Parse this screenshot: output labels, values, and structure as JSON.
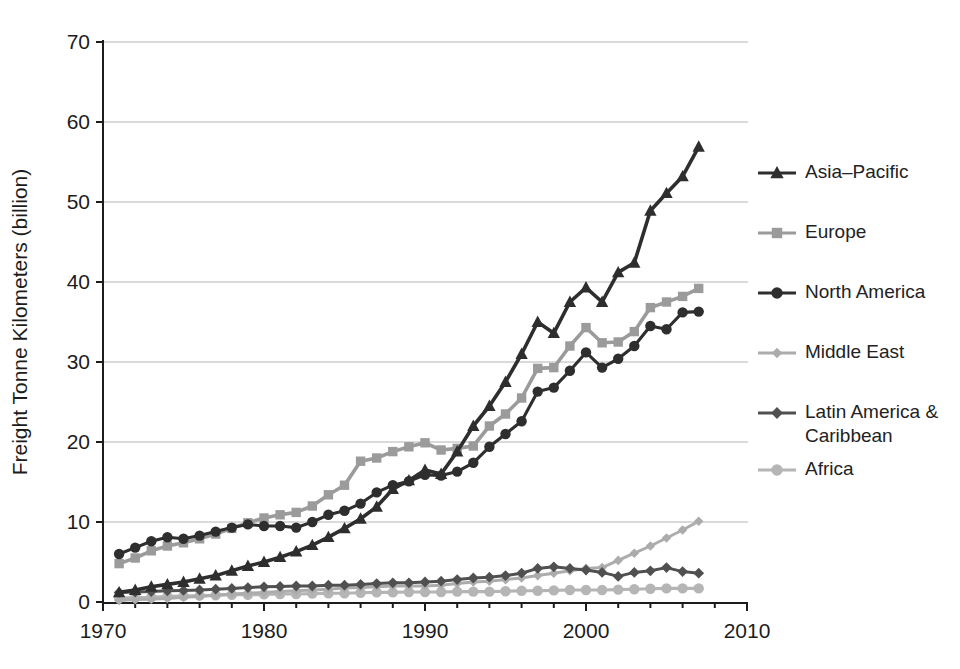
{
  "chart_data": {
    "type": "line",
    "title": "",
    "xlabel": "",
    "ylabel": "Freight Tonne Kilometers (billion)",
    "xlim": [
      1970,
      2010
    ],
    "ylim": [
      0,
      70
    ],
    "x_ticks": [
      1970,
      1980,
      1990,
      2000,
      2010
    ],
    "y_ticks": [
      0,
      10,
      20,
      30,
      40,
      50,
      60,
      70
    ],
    "minor_x_tick_step_years": 2,
    "grid": "horizontal",
    "gridline_color": "#b4b4b4",
    "axis_color": "#1c1c1c",
    "legend_position": "right",
    "x": [
      1971,
      1972,
      1973,
      1974,
      1975,
      1976,
      1977,
      1978,
      1979,
      1980,
      1981,
      1982,
      1983,
      1984,
      1985,
      1986,
      1987,
      1988,
      1989,
      1990,
      1991,
      1992,
      1993,
      1994,
      1995,
      1996,
      1997,
      1998,
      1999,
      2000,
      2001,
      2002,
      2003,
      2004,
      2005,
      2006,
      2007
    ],
    "series": [
      {
        "name": "Asia–Pacific",
        "marker": "triangle",
        "color": "#2e2e2e",
        "values": [
          1.2,
          1.5,
          1.9,
          2.2,
          2.5,
          2.9,
          3.3,
          3.9,
          4.5,
          5.0,
          5.6,
          6.3,
          7.1,
          8.1,
          9.2,
          10.4,
          11.9,
          14.1,
          15.2,
          16.5,
          16.0,
          18.8,
          22.0,
          24.5,
          27.5,
          31.0,
          35.0,
          33.6,
          37.5,
          39.3,
          37.5,
          41.2,
          42.4,
          48.9,
          51.1,
          53.2,
          56.9
        ]
      },
      {
        "name": "Europe",
        "marker": "square",
        "color": "#9b9b9b",
        "values": [
          4.8,
          5.5,
          6.4,
          7.0,
          7.4,
          7.9,
          8.5,
          9.2,
          9.9,
          10.5,
          10.9,
          11.2,
          12.0,
          13.4,
          14.6,
          17.6,
          18.0,
          18.8,
          19.4,
          19.9,
          19.0,
          19.2,
          19.5,
          22.0,
          23.5,
          25.5,
          29.2,
          29.3,
          32.0,
          34.3,
          32.4,
          32.5,
          33.8,
          36.8,
          37.5,
          38.2,
          39.2
        ]
      },
      {
        "name": "North America",
        "marker": "circle",
        "color": "#2e2e2e",
        "values": [
          6.0,
          6.8,
          7.6,
          8.1,
          7.9,
          8.3,
          8.8,
          9.3,
          9.7,
          9.5,
          9.5,
          9.3,
          10.0,
          10.9,
          11.4,
          12.3,
          13.7,
          14.6,
          15.1,
          15.9,
          15.8,
          16.3,
          17.4,
          19.4,
          21.0,
          22.6,
          26.3,
          26.8,
          28.9,
          31.2,
          29.3,
          30.4,
          32.0,
          34.5,
          34.1,
          36.2,
          36.3
        ]
      },
      {
        "name": "Middle East",
        "marker": "diamond",
        "color": "#acacac",
        "values": [
          0.2,
          0.3,
          0.35,
          0.45,
          0.6,
          0.7,
          0.85,
          1.0,
          1.1,
          1.2,
          1.3,
          1.4,
          1.5,
          1.6,
          1.75,
          1.8,
          1.9,
          2.0,
          2.0,
          2.0,
          2.1,
          2.3,
          2.5,
          2.6,
          2.8,
          3.0,
          3.3,
          3.6,
          3.9,
          4.2,
          4.3,
          5.2,
          6.1,
          7.0,
          8.0,
          9.0,
          10.1
        ]
      },
      {
        "name": "Latin America & Caribbean",
        "marker": "diamond",
        "color": "#505050",
        "values": [
          1.2,
          1.25,
          1.3,
          1.4,
          1.45,
          1.5,
          1.6,
          1.7,
          1.8,
          1.9,
          1.95,
          2.0,
          2.0,
          2.1,
          2.1,
          2.2,
          2.3,
          2.4,
          2.4,
          2.5,
          2.6,
          2.8,
          3.0,
          3.1,
          3.3,
          3.6,
          4.2,
          4.4,
          4.2,
          4.0,
          3.7,
          3.2,
          3.7,
          3.9,
          4.3,
          3.8,
          3.6
        ]
      },
      {
        "name": "Africa",
        "marker": "circle",
        "color": "#b5b5b5",
        "values": [
          0.5,
          0.55,
          0.6,
          0.7,
          0.75,
          0.8,
          0.85,
          0.9,
          0.9,
          0.95,
          1.0,
          1.0,
          1.05,
          1.1,
          1.1,
          1.15,
          1.2,
          1.2,
          1.25,
          1.25,
          1.25,
          1.3,
          1.3,
          1.3,
          1.35,
          1.4,
          1.4,
          1.45,
          1.5,
          1.5,
          1.5,
          1.55,
          1.6,
          1.65,
          1.7,
          1.7,
          1.7
        ]
      }
    ]
  }
}
